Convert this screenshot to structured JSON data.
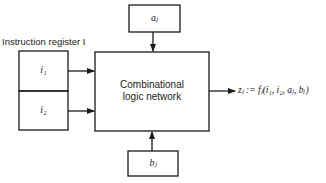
{
  "diagram": {
    "register_label": "Instruction register I",
    "register_cells": [
      "i₁",
      "i₂"
    ],
    "inputs": {
      "top": "aⱼ",
      "bottom": "bⱼ"
    },
    "main_block": {
      "line1": "Combinational",
      "line2": "logic network"
    },
    "output_expression": "zⱼ := fⱼ(i₁, i₂, aⱼ, bⱼ)",
    "stroke_color": "#1a1a1a",
    "background_color": "#ffffff"
  }
}
